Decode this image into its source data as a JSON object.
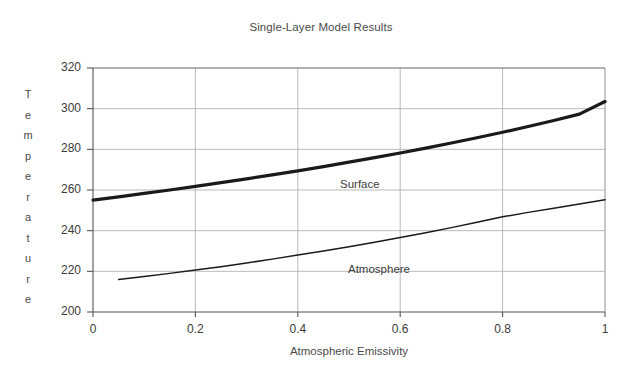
{
  "chart_data": {
    "type": "line",
    "title": "Single-Layer Model Results",
    "xlabel": "Atmospheric Emissivity",
    "ylabel": "Temperature",
    "xlim": [
      0,
      1
    ],
    "ylim": [
      200,
      320
    ],
    "xticks": [
      "0",
      "0.2",
      "0.4",
      "0.6",
      "0.8",
      "1"
    ],
    "xtick_values": [
      0,
      0.2,
      0.4,
      0.6,
      0.8,
      1
    ],
    "yticks": [
      "200",
      "220",
      "240",
      "260",
      "280",
      "300",
      "320"
    ],
    "ytick_values": [
      200,
      220,
      240,
      260,
      280,
      300,
      320
    ],
    "grid": true,
    "legend_position": "inline-annotations",
    "series": [
      {
        "name": "Surface",
        "label": "Surface",
        "color": "#1a1a1a",
        "line_width": 3.2,
        "x": [
          0,
          0.05,
          0.1,
          0.15,
          0.2,
          0.25,
          0.3,
          0.35,
          0.4,
          0.45,
          0.5,
          0.55,
          0.6,
          0.65,
          0.7,
          0.75,
          0.8,
          0.85,
          0.9,
          0.95,
          1
        ],
        "values": [
          255,
          256.6,
          258.3,
          260.0,
          261.8,
          263.6,
          265.5,
          267.4,
          269.4,
          271.5,
          273.7,
          275.9,
          278.2,
          280.6,
          283.1,
          285.7,
          288.4,
          291.2,
          294.2,
          297.3,
          303.5
        ]
      },
      {
        "name": "Atmosphere",
        "label": "Atmosphere",
        "color": "#1a1a1a",
        "line_width": 1.5,
        "x": [
          0.05,
          0.1,
          0.15,
          0.2,
          0.25,
          0.3,
          0.35,
          0.4,
          0.45,
          0.5,
          0.55,
          0.6,
          0.65,
          0.7,
          0.75,
          0.8,
          0.85,
          0.9,
          0.95,
          1
        ],
        "values": [
          216,
          217.4,
          219.0,
          220.6,
          222.3,
          224.1,
          226.0,
          228.0,
          230.0,
          232.1,
          234.3,
          236.6,
          239.0,
          241.5,
          244.1,
          246.8,
          249.0,
          251.0,
          253.1,
          255.2
        ]
      }
    ]
  },
  "axis": {
    "y_title_letters": [
      "T",
      "e",
      "m",
      "p",
      "e",
      "r",
      "a",
      "t",
      "u",
      "r",
      "e"
    ]
  }
}
